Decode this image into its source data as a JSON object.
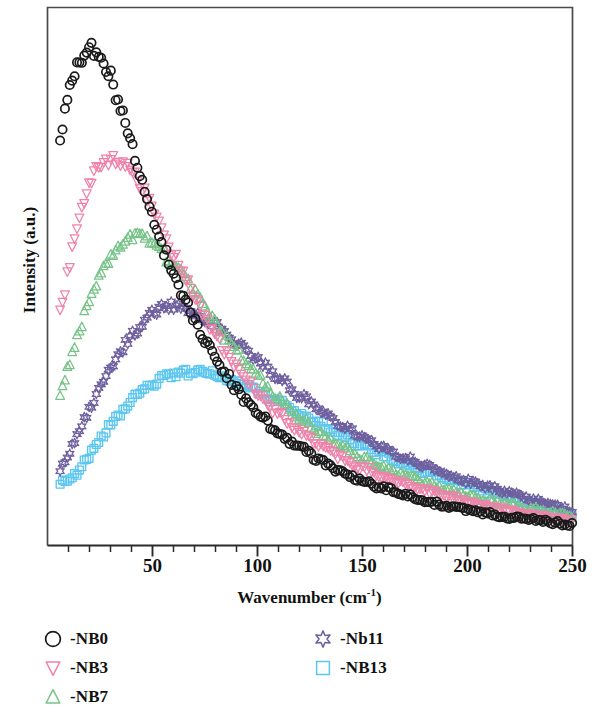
{
  "figure": {
    "background": "#ffffff",
    "frame_color": "#4a4a4a"
  },
  "axes": {
    "x_label_text": "Wavenumber (cm",
    "x_label_sup": "-1",
    "x_label_close": ")",
    "y_label": "Intensity (a.u.)",
    "x_ticks": [
      {
        "value": 50,
        "label": "50"
      },
      {
        "value": 100,
        "label": "100"
      },
      {
        "value": 150,
        "label": "150"
      },
      {
        "value": 200,
        "label": "200"
      },
      {
        "value": 250,
        "label": "250"
      }
    ],
    "x_minor_step": 10,
    "x_min": 0,
    "x_max": 250,
    "y_min": 0,
    "y_max": 1.0
  },
  "legend": {
    "columns": [
      {
        "entries": [
          {
            "label": "-NB0",
            "marker": "circle",
            "color": "#1a1a1a",
            "series": "NB0"
          },
          {
            "label": "-NB3",
            "marker": "triangle-down",
            "color": "#ef82aa",
            "series": "NB3"
          },
          {
            "label": "-NB7",
            "marker": "triangle-up",
            "color": "#78c389",
            "series": "NB7"
          }
        ]
      },
      {
        "entries": [
          {
            "label": "-Nb11",
            "marker": "star6",
            "color": "#6e5f9e",
            "series": "Nb11"
          },
          {
            "label": "-NB13",
            "marker": "square",
            "color": "#5bc6ef",
            "series": "NB13"
          }
        ]
      }
    ]
  },
  "chart_data": {
    "type": "scatter",
    "title": "",
    "xlabel": "Wavenumber (cm-1)",
    "ylabel": "Intensity (a.u.)",
    "xlim": [
      0,
      250
    ],
    "ylim": [
      0,
      1.0
    ],
    "grid": false,
    "legend_position": "below-axes",
    "x_tick_labels": [
      "50",
      "100",
      "150",
      "200",
      "250"
    ],
    "y_tick_labels": [],
    "series": [
      {
        "name": "-NB0",
        "marker": "circle",
        "color": "#1a1a1a",
        "filled": false,
        "peak_x": 22,
        "peak_y": 0.922,
        "x": [
          6,
          8,
          10,
          12,
          14,
          16,
          18,
          20,
          22,
          24,
          26,
          28,
          30,
          33,
          36,
          39,
          42,
          45,
          48,
          52,
          56,
          60,
          65,
          70,
          75,
          80,
          85,
          90,
          95,
          100,
          110,
          120,
          130,
          140,
          150,
          160,
          170,
          180,
          190,
          200,
          210,
          220,
          230,
          240,
          250
        ],
        "y": [
          0.76,
          0.8,
          0.838,
          0.866,
          0.888,
          0.903,
          0.914,
          0.92,
          0.922,
          0.918,
          0.908,
          0.893,
          0.872,
          0.836,
          0.797,
          0.757,
          0.716,
          0.676,
          0.637,
          0.589,
          0.545,
          0.505,
          0.459,
          0.418,
          0.381,
          0.348,
          0.318,
          0.291,
          0.267,
          0.246,
          0.21,
          0.181,
          0.157,
          0.137,
          0.12,
          0.106,
          0.094,
          0.083,
          0.074,
          0.066,
          0.059,
          0.053,
          0.048,
          0.043,
          0.039
        ]
      },
      {
        "name": "-NB3",
        "marker": "triangle-down",
        "color": "#ef82aa",
        "filled": false,
        "peak_x": 33,
        "peak_y": 0.718,
        "x": [
          6,
          8,
          10,
          12,
          14,
          16,
          18,
          20,
          22,
          25,
          28,
          31,
          33,
          36,
          39,
          42,
          45,
          48,
          52,
          56,
          60,
          65,
          70,
          75,
          80,
          85,
          90,
          95,
          100,
          110,
          120,
          130,
          140,
          150,
          160,
          170,
          180,
          190,
          200,
          210,
          220,
          230,
          240,
          250
        ],
        "y": [
          0.43,
          0.472,
          0.512,
          0.551,
          0.586,
          0.618,
          0.646,
          0.669,
          0.687,
          0.705,
          0.714,
          0.718,
          0.718,
          0.712,
          0.701,
          0.686,
          0.667,
          0.645,
          0.612,
          0.578,
          0.543,
          0.501,
          0.461,
          0.424,
          0.39,
          0.359,
          0.331,
          0.306,
          0.283,
          0.244,
          0.212,
          0.185,
          0.163,
          0.144,
          0.128,
          0.114,
          0.102,
          0.091,
          0.082,
          0.073,
          0.065,
          0.058,
          0.052,
          0.046
        ]
      },
      {
        "name": "-NB7",
        "marker": "triangle-up",
        "color": "#78c389",
        "filled": false,
        "peak_x": 45,
        "peak_y": 0.572,
        "x": [
          6,
          8,
          10,
          12,
          14,
          16,
          18,
          20,
          23,
          26,
          29,
          32,
          35,
          38,
          41,
          44,
          47,
          50,
          54,
          58,
          62,
          66,
          70,
          75,
          80,
          85,
          90,
          95,
          100,
          110,
          120,
          130,
          140,
          150,
          160,
          170,
          180,
          190,
          200,
          210,
          220,
          230,
          240,
          250
        ],
        "y": [
          0.282,
          0.308,
          0.334,
          0.36,
          0.386,
          0.411,
          0.434,
          0.456,
          0.485,
          0.51,
          0.531,
          0.548,
          0.56,
          0.568,
          0.572,
          0.572,
          0.568,
          0.561,
          0.548,
          0.531,
          0.512,
          0.491,
          0.469,
          0.441,
          0.413,
          0.386,
          0.36,
          0.336,
          0.313,
          0.272,
          0.237,
          0.208,
          0.184,
          0.163,
          0.145,
          0.13,
          0.117,
          0.105,
          0.094,
          0.085,
          0.076,
          0.068,
          0.061,
          0.054
        ]
      },
      {
        "name": "-Nb11",
        "marker": "star6",
        "color": "#6e5f9e",
        "filled": false,
        "peak_x": 57,
        "peak_y": 0.446,
        "x": [
          6,
          8,
          10,
          12,
          15,
          18,
          21,
          24,
          27,
          30,
          34,
          38,
          42,
          46,
          50,
          54,
          57,
          60,
          64,
          68,
          72,
          76,
          80,
          85,
          90,
          95,
          100,
          110,
          120,
          130,
          140,
          150,
          160,
          170,
          180,
          190,
          200,
          210,
          220,
          230,
          240,
          250
        ],
        "y": [
          0.138,
          0.153,
          0.169,
          0.185,
          0.21,
          0.236,
          0.261,
          0.286,
          0.309,
          0.33,
          0.356,
          0.379,
          0.399,
          0.416,
          0.43,
          0.441,
          0.446,
          0.446,
          0.443,
          0.438,
          0.43,
          0.421,
          0.41,
          0.395,
          0.379,
          0.362,
          0.345,
          0.311,
          0.279,
          0.25,
          0.224,
          0.201,
          0.181,
          0.163,
          0.147,
          0.133,
          0.12,
          0.108,
          0.097,
          0.086,
          0.076,
          0.066
        ]
      },
      {
        "name": "-NB13",
        "marker": "square",
        "color": "#5bc6ef",
        "filled": false,
        "peak_x": 72,
        "peak_y": 0.322,
        "x": [
          6,
          8,
          10,
          13,
          16,
          19,
          22,
          26,
          30,
          34,
          38,
          42,
          46,
          50,
          55,
          60,
          65,
          70,
          72,
          76,
          80,
          85,
          90,
          95,
          100,
          110,
          120,
          130,
          140,
          150,
          160,
          170,
          180,
          190,
          200,
          210,
          220,
          230,
          240,
          250
        ],
        "y": [
          0.118,
          0.118,
          0.121,
          0.131,
          0.146,
          0.163,
          0.18,
          0.202,
          0.223,
          0.242,
          0.26,
          0.276,
          0.29,
          0.301,
          0.311,
          0.317,
          0.321,
          0.322,
          0.322,
          0.32,
          0.317,
          0.311,
          0.304,
          0.296,
          0.287,
          0.267,
          0.246,
          0.225,
          0.205,
          0.186,
          0.169,
          0.153,
          0.138,
          0.125,
          0.113,
          0.101,
          0.09,
          0.079,
          0.069,
          0.059
        ]
      }
    ]
  }
}
